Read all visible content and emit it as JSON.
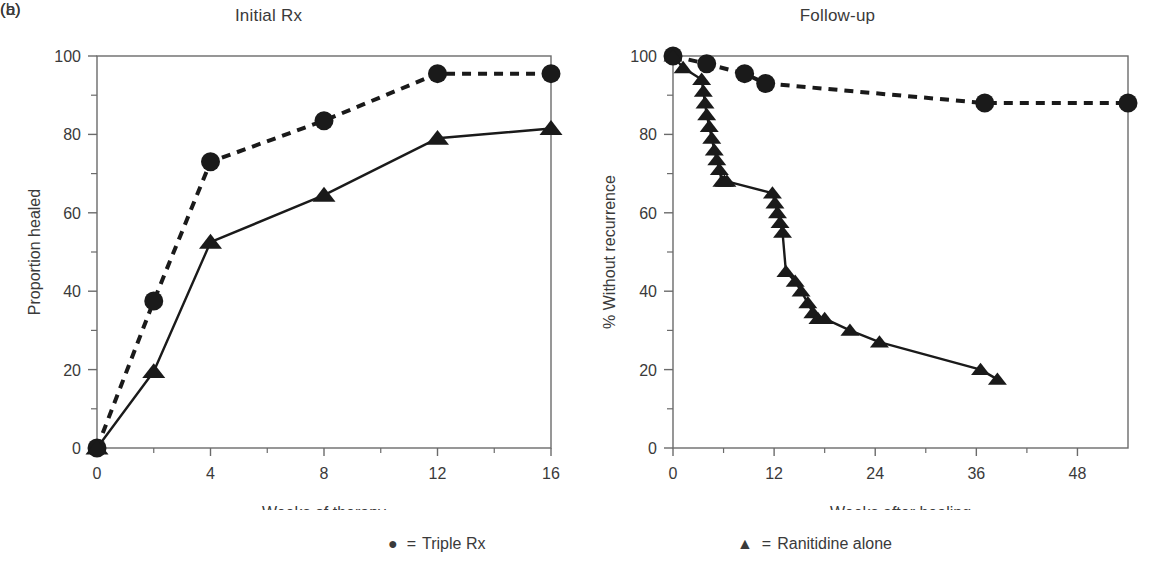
{
  "figure": {
    "background": "#ffffff",
    "ink_color": "#1a1a1a",
    "axis_color": "#6b6b6b",
    "text_color": "#3a3a3a"
  },
  "legend": {
    "items": [
      {
        "marker": "circle-marker",
        "glyph": "●",
        "equals": "=",
        "label": "Triple Rx"
      },
      {
        "marker": "triangle-marker",
        "glyph": "▲",
        "equals": "=",
        "label": "Ranitidine  alone"
      }
    ]
  },
  "chart_data": [
    {
      "type": "line",
      "panel": "a",
      "panel_letter": "(a)",
      "title": "Initial Rx",
      "xlabel": "Weeks of therapy",
      "ylabel": "Proportion healed",
      "xlim": [
        0,
        16
      ],
      "ylim": [
        0,
        100
      ],
      "xticks": [
        0,
        4,
        8,
        12,
        16
      ],
      "xtick_labels": [
        "0",
        "4",
        "8",
        "12",
        "16"
      ],
      "xminor_ticks": [
        2,
        6,
        10,
        14
      ],
      "yticks": [
        0,
        20,
        40,
        60,
        80,
        100
      ],
      "ytick_labels": [
        "0",
        "20",
        "40",
        "60",
        "80",
        "100"
      ],
      "yminor_ticks": [
        10,
        30,
        50,
        70,
        90
      ],
      "grid": false,
      "legend_position": "below-figure",
      "series": [
        {
          "name": "Triple Rx",
          "marker": "circle",
          "linestyle": "dashed",
          "x": [
            0,
            2,
            4,
            8,
            12,
            16
          ],
          "values": [
            0,
            37.5,
            73,
            83.5,
            95.5,
            95.5
          ]
        },
        {
          "name": "Ranitidine alone",
          "marker": "triangle",
          "linestyle": "solid",
          "x": [
            0,
            2,
            4,
            8,
            12,
            16
          ],
          "values": [
            0,
            19.5,
            52.5,
            64.5,
            79,
            81.5
          ]
        }
      ]
    },
    {
      "type": "line",
      "panel": "b",
      "panel_letter": "(b)",
      "title": "Follow-up",
      "xlabel": "Weeks after healing",
      "ylabel": "% Without recurrence",
      "xlim": [
        0,
        54
      ],
      "ylim": [
        0,
        100
      ],
      "xticks": [
        0,
        12,
        24,
        36,
        48
      ],
      "xtick_labels": [
        "0",
        "12",
        "24",
        "36",
        "48"
      ],
      "xminor_ticks": [
        6,
        18,
        30,
        42
      ],
      "yticks": [
        0,
        20,
        40,
        60,
        80,
        100
      ],
      "ytick_labels": [
        "0",
        "20",
        "40",
        "60",
        "80",
        "100"
      ],
      "yminor_ticks": [
        10,
        30,
        50,
        70,
        90
      ],
      "grid": false,
      "legend_position": "below-figure",
      "series": [
        {
          "name": "Triple Rx",
          "marker": "circle",
          "linestyle": "dashed",
          "x": [
            0,
            4,
            8.5,
            11,
            37,
            54
          ],
          "values": [
            100,
            98,
            95.5,
            93,
            88,
            88
          ]
        },
        {
          "name": "Ranitidine alone",
          "marker": "triangle",
          "linestyle": "solid",
          "x": [
            0,
            1.2,
            3.4,
            3.6,
            3.8,
            4.0,
            4.3,
            4.6,
            4.9,
            5.2,
            5.5,
            5.8,
            6.1,
            6.4,
            11.8,
            12.1,
            12.4,
            12.7,
            13.0,
            13.4,
            14.5,
            15.2,
            16.0,
            16.6,
            17.2,
            18.0,
            21.0,
            24.5,
            36.5,
            38.5
          ],
          "values": [
            100,
            97,
            94,
            91,
            88,
            85,
            82,
            79,
            76,
            73.5,
            71,
            68,
            68,
            68,
            65,
            62.5,
            60,
            57.5,
            55,
            45,
            42.5,
            40,
            37,
            34.5,
            33,
            33,
            30,
            27,
            20,
            17.5
          ]
        }
      ]
    }
  ]
}
